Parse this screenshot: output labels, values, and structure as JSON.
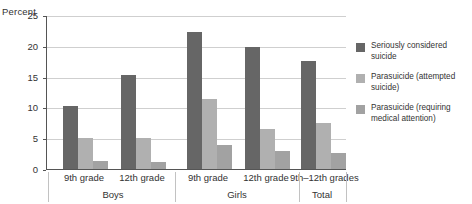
{
  "chart_data": {
    "type": "bar",
    "title": "",
    "subtitle": "",
    "xlabel": "",
    "ylabel": "Percent",
    "ylim": [
      0,
      25
    ],
    "yticks": [
      0,
      5,
      10,
      15,
      20,
      25
    ],
    "ytick_labels": [
      "0",
      "5",
      "10",
      "15",
      "20",
      "25"
    ],
    "grid": true,
    "legend_position": "right",
    "groups": [
      {
        "name": "Boys",
        "categories": [
          "9th grade",
          "12th grade"
        ]
      },
      {
        "name": "Girls",
        "categories": [
          "9th grade",
          "12th grade"
        ]
      },
      {
        "name": "Total",
        "categories": [
          "9th–12th grades"
        ]
      }
    ],
    "categories": [
      "9th grade",
      "12th grade",
      "9th grade",
      "12th grade",
      "9th–12th grades"
    ],
    "series": [
      {
        "name": "Seriously considered suicide",
        "color": "#666666",
        "values": [
          10.3,
          15.3,
          22.4,
          19.9,
          17.6
        ]
      },
      {
        "name": "Parasuicide (attempted suicide)",
        "color": "#b0b0b0",
        "values": [
          5.0,
          5.1,
          11.4,
          6.5,
          7.6
        ]
      },
      {
        "name": "Parasuicide (requiring medical attention)",
        "color": "#a2a2a2",
        "values": [
          1.3,
          1.2,
          4.0,
          2.9,
          2.6
        ]
      }
    ]
  },
  "axis": {
    "y_title": "Percent",
    "ticks": [
      {
        "label": "25",
        "value": 25
      },
      {
        "label": "20",
        "value": 20
      },
      {
        "label": "15",
        "value": 15
      },
      {
        "label": "10",
        "value": 10
      },
      {
        "label": "5",
        "value": 5
      },
      {
        "label": "0",
        "value": 0
      }
    ]
  },
  "categories_axis": {
    "items": [
      {
        "label": "9th grade"
      },
      {
        "label": "12th grade"
      },
      {
        "label": "9th grade"
      },
      {
        "label": "12th grade"
      },
      {
        "label": "9th–12th grades"
      }
    ],
    "groups": [
      {
        "label": "Boys"
      },
      {
        "label": "Girls"
      },
      {
        "label": "Total"
      }
    ]
  },
  "legend": {
    "items": [
      {
        "label": "Seriously considered suicide",
        "color": "#666666"
      },
      {
        "label": "Parasuicide (attempted suicide)",
        "color": "#b0b0b0"
      },
      {
        "label": "Parasuicide (requiring medical attention)",
        "color": "#a2a2a2"
      }
    ]
  },
  "colors": {
    "series_1": "#666666",
    "series_2": "#b0b0b0",
    "series_3": "#a2a2a2",
    "grid": "#cfcfcf",
    "axis": "#555555",
    "text": "#333333",
    "background": "#ffffff"
  }
}
